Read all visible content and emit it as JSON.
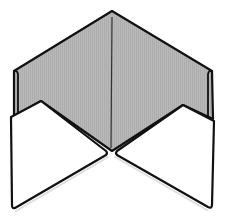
{
  "diagram": {
    "colors": {
      "background": "#ffffff",
      "inner_paper": "#b8b8b8",
      "outer_flap": "#ffffff",
      "stroke": "#111111",
      "center_crease": "#333333"
    },
    "parts": [
      {
        "name": "back-panel",
        "label": "Gray inner paper (back panel)"
      },
      {
        "name": "left-strip",
        "label": "Left folded edge strip"
      },
      {
        "name": "right-strip",
        "label": "Right folded edge strip"
      },
      {
        "name": "left-front-flap",
        "label": "Left white front flap"
      },
      {
        "name": "right-front-flap",
        "label": "Right white front flap"
      },
      {
        "name": "center-crease",
        "label": "Vertical center crease"
      }
    ]
  }
}
